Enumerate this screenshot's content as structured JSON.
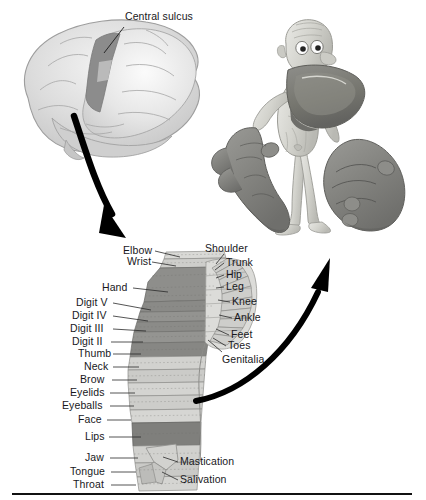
{
  "figure": {
    "brain_label": "Central sulcus",
    "bottom_rule": true
  },
  "colors": {
    "page_background": "#ffffff",
    "text": "#18181c",
    "arrow": "#000000",
    "brain_fill": "#d9d9d9",
    "brain_outline": "#9a9a9a",
    "central_sulcus_band": "#8c8c8c",
    "strip_light": "#d7d7d5",
    "strip_mid": "#c2c2bf",
    "strip_dark": "#8e8e8e",
    "strip_darkest": "#7c7c7c",
    "homunculus_skin": "#d5d5d0",
    "homunculus_dark": "#7e7e7e",
    "rule": "#111111"
  },
  "left_labels": [
    {
      "text": "Elbow",
      "x": 123,
      "y": 245,
      "lx1": 155,
      "ly1": 251,
      "lx2": 180,
      "ly2": 257
    },
    {
      "text": "Wrist",
      "x": 127,
      "y": 256,
      "lx1": 152,
      "ly1": 262,
      "lx2": 176,
      "ly2": 266
    },
    {
      "text": "Hand",
      "x": 102,
      "y": 282,
      "lx1": 133,
      "ly1": 288,
      "lx2": 168,
      "ly2": 292
    },
    {
      "text": "Digit V",
      "x": 76,
      "y": 297,
      "lx1": 113,
      "ly1": 303,
      "lx2": 151,
      "ly2": 310
    },
    {
      "text": "Digit IV",
      "x": 72,
      "y": 310,
      "lx1": 113,
      "ly1": 316,
      "lx2": 148,
      "ly2": 321
    },
    {
      "text": "Digit III",
      "x": 70,
      "y": 323,
      "lx1": 113,
      "ly1": 329,
      "lx2": 146,
      "ly2": 331
    },
    {
      "text": "Digit II",
      "x": 72,
      "y": 336,
      "lx1": 111,
      "ly1": 342,
      "lx2": 143,
      "ly2": 342
    },
    {
      "text": "Thumb",
      "x": 78,
      "y": 348,
      "lx1": 113,
      "ly1": 354,
      "lx2": 141,
      "ly2": 354
    },
    {
      "text": "Neck",
      "x": 84,
      "y": 361,
      "lx1": 113,
      "ly1": 367,
      "lx2": 139,
      "ly2": 367
    },
    {
      "text": "Brow",
      "x": 80,
      "y": 374,
      "lx1": 112,
      "ly1": 380,
      "lx2": 137,
      "ly2": 380
    },
    {
      "text": "Eyelids",
      "x": 70,
      "y": 387,
      "lx1": 110,
      "ly1": 393,
      "lx2": 135,
      "ly2": 393
    },
    {
      "text": "Eyeballs",
      "x": 62,
      "y": 400,
      "lx1": 110,
      "ly1": 406,
      "lx2": 134,
      "ly2": 406
    },
    {
      "text": "Face",
      "x": 78,
      "y": 414,
      "lx1": 107,
      "ly1": 420,
      "lx2": 131,
      "ly2": 420
    },
    {
      "text": "Lips",
      "x": 85,
      "y": 431,
      "lx1": 109,
      "ly1": 437,
      "lx2": 141,
      "ly2": 437
    },
    {
      "text": "Jaw",
      "x": 85,
      "y": 452,
      "lx1": 110,
      "ly1": 458,
      "lx2": 138,
      "ly2": 458
    },
    {
      "text": "Tongue",
      "x": 70,
      "y": 466,
      "lx1": 111,
      "ly1": 472,
      "lx2": 136,
      "ly2": 472
    },
    {
      "text": "Throat",
      "x": 73,
      "y": 479,
      "lx1": 111,
      "ly1": 485,
      "lx2": 136,
      "ly2": 485
    }
  ],
  "right_labels": [
    {
      "text": "Shoulder",
      "x": 205,
      "y": 243,
      "lx1": 224,
      "ly1": 254,
      "lx2": 216,
      "ly2": 264
    },
    {
      "text": "Trunk",
      "x": 226,
      "y": 257,
      "lx1": 224,
      "ly1": 263,
      "lx2": 215,
      "ly2": 270
    },
    {
      "text": "Hip",
      "x": 226,
      "y": 269,
      "lx1": 224,
      "ly1": 275,
      "lx2": 216,
      "ly2": 278
    },
    {
      "text": "Leg",
      "x": 226,
      "y": 281,
      "lx1": 224,
      "ly1": 287,
      "lx2": 216,
      "ly2": 288
    },
    {
      "text": "Knee",
      "x": 232,
      "y": 296,
      "lx1": 230,
      "ly1": 302,
      "lx2": 218,
      "ly2": 300
    },
    {
      "text": "Ankle",
      "x": 234,
      "y": 312,
      "lx1": 232,
      "ly1": 318,
      "lx2": 219,
      "ly2": 315
    },
    {
      "text": "Feet",
      "x": 231,
      "y": 329,
      "lx1": 229,
      "ly1": 335,
      "lx2": 216,
      "ly2": 329
    },
    {
      "text": "Toes",
      "x": 228,
      "y": 340,
      "lx1": 226,
      "ly1": 346,
      "lx2": 213,
      "ly2": 338
    },
    {
      "text": "Genitalia",
      "x": 222,
      "y": 354,
      "lx1": 222,
      "ly1": 352,
      "lx2": 208,
      "ly2": 340
    },
    {
      "text": "Mastication",
      "x": 180,
      "y": 456,
      "lx1": 178,
      "ly1": 462,
      "lx2": 163,
      "ly2": 457
    },
    {
      "text": "Salivation",
      "x": 180,
      "y": 474,
      "lx1": 178,
      "ly1": 480,
      "lx2": 162,
      "ly2": 472
    }
  ],
  "regions": {
    "brain": "lateral view of cerebral hemisphere with shaded central sulcus band",
    "homunculus": "distorted human figure with oversized hands, lips and tongue",
    "cortical_strip": "cross-section of the postcentral gyrus with proportional body-part bands",
    "arrow_down": "curved arrow from brain to cortical strip",
    "arrow_up": "curved arrow from cortical strip to homunculus"
  }
}
